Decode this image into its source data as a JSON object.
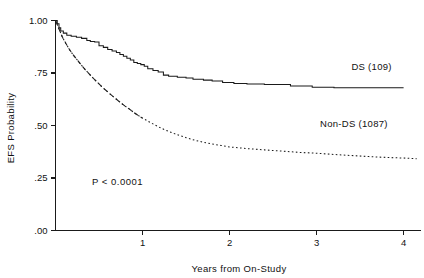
{
  "chart_data": {
    "type": "line",
    "title": "",
    "subtitle": "",
    "xlabel": "Years from On-Study",
    "ylabel": "EFS Probability",
    "xlim": [
      0,
      4.2
    ],
    "ylim": [
      0,
      1.0
    ],
    "grid": false,
    "legend_position": "inline-right",
    "xticks": [
      1,
      2,
      3,
      4
    ],
    "xticklabels": [
      "1",
      "2",
      "3",
      "4"
    ],
    "yticks": [
      0.0,
      0.25,
      0.5,
      0.75,
      1.0
    ],
    "yticklabels": [
      ".00",
      ".25",
      ".50",
      ".75",
      "1.00"
    ],
    "annotations": [
      {
        "name": "p-value",
        "text": "P < 0.0001",
        "x": 0.42,
        "y": 0.215
      },
      {
        "name": "ds-series-label",
        "text": "DS (109)",
        "x": 3.4,
        "y": 0.765
      },
      {
        "name": "nondsries-label",
        "text": "Non-DS (1087)",
        "x": 3.04,
        "y": 0.495
      }
    ],
    "series": [
      {
        "name": "DS (109)",
        "n": 109,
        "style": "solid",
        "step": true,
        "color": "#1a1a1a",
        "points": [
          [
            0.0,
            1.0
          ],
          [
            0.02,
            0.985
          ],
          [
            0.04,
            0.965
          ],
          [
            0.06,
            0.95
          ],
          [
            0.09,
            0.94
          ],
          [
            0.13,
            0.93
          ],
          [
            0.18,
            0.925
          ],
          [
            0.24,
            0.92
          ],
          [
            0.3,
            0.915
          ],
          [
            0.36,
            0.905
          ],
          [
            0.4,
            0.9
          ],
          [
            0.45,
            0.898
          ],
          [
            0.5,
            0.88
          ],
          [
            0.55,
            0.872
          ],
          [
            0.6,
            0.862
          ],
          [
            0.65,
            0.855
          ],
          [
            0.7,
            0.848
          ],
          [
            0.74,
            0.838
          ],
          [
            0.78,
            0.83
          ],
          [
            0.82,
            0.82
          ],
          [
            0.86,
            0.812
          ],
          [
            0.9,
            0.8
          ],
          [
            0.94,
            0.795
          ],
          [
            0.98,
            0.79
          ],
          [
            1.02,
            0.782
          ],
          [
            1.06,
            0.77
          ],
          [
            1.12,
            0.762
          ],
          [
            1.18,
            0.755
          ],
          [
            1.24,
            0.74
          ],
          [
            1.3,
            0.735
          ],
          [
            1.4,
            0.73
          ],
          [
            1.5,
            0.726
          ],
          [
            1.58,
            0.72
          ],
          [
            1.7,
            0.716
          ],
          [
            1.8,
            0.712
          ],
          [
            1.92,
            0.705
          ],
          [
            2.05,
            0.7
          ],
          [
            2.2,
            0.698
          ],
          [
            2.4,
            0.695
          ],
          [
            2.7,
            0.688
          ],
          [
            2.95,
            0.682
          ],
          [
            3.2,
            0.68
          ],
          [
            3.6,
            0.68
          ],
          [
            4.0,
            0.68
          ]
        ]
      },
      {
        "name": "Non-DS (1087)",
        "n": 1087,
        "style": "dotted",
        "step": false,
        "color": "#1a1a1a",
        "points": [
          [
            0.0,
            1.0
          ],
          [
            0.04,
            0.96
          ],
          [
            0.08,
            0.92
          ],
          [
            0.12,
            0.89
          ],
          [
            0.16,
            0.862
          ],
          [
            0.2,
            0.838
          ],
          [
            0.25,
            0.812
          ],
          [
            0.3,
            0.786
          ],
          [
            0.35,
            0.762
          ],
          [
            0.4,
            0.74
          ],
          [
            0.45,
            0.718
          ],
          [
            0.5,
            0.698
          ],
          [
            0.55,
            0.678
          ],
          [
            0.6,
            0.66
          ],
          [
            0.65,
            0.642
          ],
          [
            0.7,
            0.625
          ],
          [
            0.75,
            0.608
          ],
          [
            0.8,
            0.592
          ],
          [
            0.85,
            0.578
          ],
          [
            0.9,
            0.562
          ],
          [
            0.95,
            0.548
          ],
          [
            1.0,
            0.535
          ],
          [
            1.1,
            0.512
          ],
          [
            1.2,
            0.49
          ],
          [
            1.3,
            0.472
          ],
          [
            1.4,
            0.456
          ],
          [
            1.5,
            0.442
          ],
          [
            1.6,
            0.43
          ],
          [
            1.7,
            0.42
          ],
          [
            1.8,
            0.412
          ],
          [
            1.9,
            0.405
          ],
          [
            2.0,
            0.398
          ],
          [
            2.2,
            0.39
          ],
          [
            2.4,
            0.384
          ],
          [
            2.6,
            0.378
          ],
          [
            2.8,
            0.372
          ],
          [
            3.0,
            0.368
          ],
          [
            3.2,
            0.362
          ],
          [
            3.4,
            0.357
          ],
          [
            3.6,
            0.352
          ],
          [
            3.8,
            0.348
          ],
          [
            4.0,
            0.345
          ],
          [
            4.15,
            0.342
          ]
        ]
      }
    ]
  },
  "figure": {
    "background": "#ffffff",
    "foreground": "#1a1a1a"
  }
}
